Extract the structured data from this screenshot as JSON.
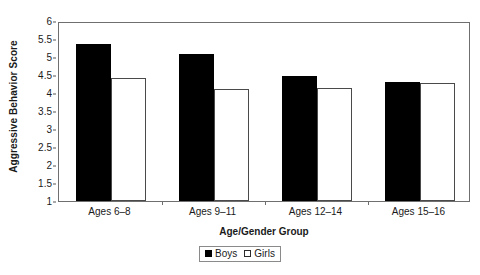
{
  "chart_data": {
    "type": "bar",
    "title": "",
    "xlabel": "Age/Gender Group",
    "ylabel": "Aggressive Behavior Score",
    "categories": [
      "Ages 6–8",
      "Ages 9–11",
      "Ages 12–14",
      "Ages 15–16"
    ],
    "series": [
      {
        "name": "Boys",
        "color": "#000000",
        "fill": "solid",
        "values": [
          5.37,
          5.07,
          4.47,
          4.3
        ]
      },
      {
        "name": "Girls",
        "color": "#ffffff",
        "fill": "hollow",
        "values": [
          4.43,
          4.12,
          4.15,
          4.28
        ]
      }
    ],
    "ylim": [
      1,
      6
    ],
    "yticks": [
      "1",
      "1.5",
      "2",
      "2.5",
      "3",
      "3.5",
      "4",
      "4.5",
      "5",
      "5.5",
      "6"
    ],
    "ytick_values": [
      1,
      1.5,
      2,
      2.5,
      3,
      3.5,
      4,
      4.5,
      5,
      5.5,
      6
    ],
    "grid": false,
    "legend_position": "bottom",
    "legend_entries": [
      "Boys",
      "Girls"
    ],
    "plot_border": true,
    "axis_color": "#6f6f6f"
  }
}
